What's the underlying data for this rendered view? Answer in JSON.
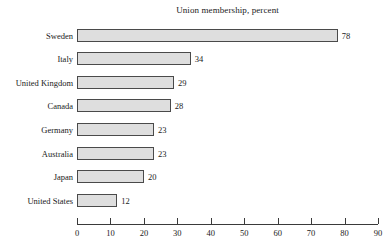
{
  "chart_data": {
    "type": "bar",
    "orientation": "horizontal",
    "title": "Union membership, percent",
    "xlabel": "",
    "ylabel": "",
    "categories": [
      "Sweden",
      "Italy",
      "United Kingdom",
      "Canada",
      "Germany",
      "Australia",
      "Japan",
      "United States"
    ],
    "values": [
      78,
      34,
      29,
      28,
      23,
      23,
      20,
      12
    ],
    "value_labels": [
      "78",
      "34",
      "29",
      "28",
      "23",
      "23",
      "20",
      "12"
    ],
    "xlim": [
      0,
      90
    ],
    "xticks": [
      0,
      10,
      20,
      30,
      40,
      50,
      60,
      70,
      80,
      90
    ],
    "xtick_labels": [
      "0",
      "10",
      "20",
      "30",
      "40",
      "50",
      "60",
      "70",
      "80",
      "90"
    ],
    "grid": false,
    "legend": "none",
    "colors": {
      "bar_fill": "#dedede",
      "bar_border": "#4a4a4a",
      "axis": "#3a3a3a",
      "text": "#1a1a1a",
      "background": "#ffffff"
    }
  }
}
